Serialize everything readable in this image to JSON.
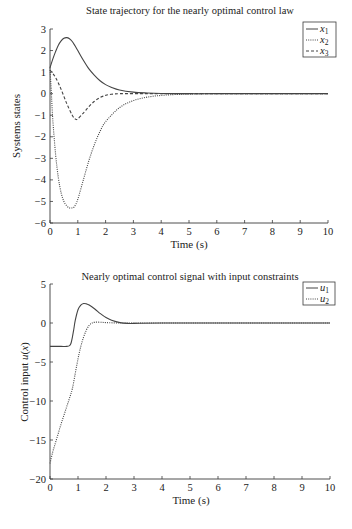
{
  "chart_data": [
    {
      "type": "line",
      "title": "State trajectory for the nearly optimal control law",
      "xlabel": "Time (s)",
      "ylabel": "Systems states",
      "xlim": [
        0,
        10
      ],
      "ylim": [
        -6,
        3
      ],
      "xticks": [
        0,
        1,
        2,
        3,
        4,
        5,
        6,
        7,
        8,
        9,
        10
      ],
      "yticks": [
        3,
        2,
        1,
        0,
        -1,
        -2,
        -3,
        -4,
        -5,
        -6
      ],
      "grid": false,
      "legend_position": "upper right",
      "series": [
        {
          "name": "x1",
          "style": "solid",
          "x": [
            0,
            0.1,
            0.2,
            0.3,
            0.4,
            0.5,
            0.6,
            0.7,
            0.8,
            0.9,
            1.0,
            1.2,
            1.4,
            1.6,
            1.8,
            2.0,
            2.2,
            2.5,
            3.0,
            3.5,
            4.0,
            5.0,
            6.0,
            8.0,
            10.0
          ],
          "values": [
            1.2,
            1.6,
            1.95,
            2.25,
            2.45,
            2.57,
            2.6,
            2.55,
            2.42,
            2.22,
            2.0,
            1.55,
            1.15,
            0.85,
            0.6,
            0.42,
            0.3,
            0.17,
            0.07,
            0.03,
            0.01,
            0.0,
            0.0,
            0.0,
            0.0
          ]
        },
        {
          "name": "x2",
          "style": "dotted",
          "x": [
            0,
            0.05,
            0.1,
            0.2,
            0.3,
            0.4,
            0.5,
            0.6,
            0.7,
            0.8,
            0.85,
            0.9,
            1.0,
            1.2,
            1.4,
            1.6,
            1.8,
            2.0,
            2.5,
            3.0,
            3.5,
            4.0,
            4.5,
            5.0,
            6.0,
            8.0,
            10.0
          ],
          "values": [
            1.2,
            0.0,
            -1.2,
            -2.8,
            -3.9,
            -4.6,
            -5.0,
            -5.2,
            -5.3,
            -5.3,
            -5.28,
            -5.2,
            -4.9,
            -4.0,
            -3.1,
            -2.35,
            -1.75,
            -1.3,
            -0.65,
            -0.32,
            -0.16,
            -0.08,
            -0.04,
            -0.02,
            0.0,
            0.0,
            0.0
          ]
        },
        {
          "name": "x3",
          "style": "dashed",
          "x": [
            0,
            0.2,
            0.4,
            0.6,
            0.8,
            0.9,
            0.95,
            1.0,
            1.2,
            1.4,
            1.6,
            1.8,
            2.0,
            2.2,
            2.5,
            3.0,
            4.0,
            6.0,
            10.0
          ],
          "values": [
            1.1,
            0.75,
            0.2,
            -0.45,
            -1.0,
            -1.17,
            -1.2,
            -1.17,
            -0.9,
            -0.6,
            -0.35,
            -0.18,
            -0.08,
            -0.03,
            0.0,
            0.0,
            0.0,
            0.0,
            0.0
          ]
        }
      ]
    },
    {
      "type": "line",
      "title": "Nearly optimal control signal with input constraints",
      "xlabel": "Time (s)",
      "ylabel": "Control input u(x)",
      "xlim": [
        0,
        10
      ],
      "ylim": [
        -20,
        5
      ],
      "xticks": [
        0,
        1,
        2,
        3,
        4,
        5,
        6,
        7,
        8,
        9,
        10
      ],
      "yticks": [
        5,
        0,
        -5,
        -10,
        -15,
        -20
      ],
      "grid": false,
      "legend_position": "upper right",
      "series": [
        {
          "name": "u1",
          "style": "solid",
          "x": [
            0,
            0.2,
            0.4,
            0.6,
            0.7,
            0.75,
            0.8,
            0.85,
            0.9,
            1.0,
            1.1,
            1.2,
            1.3,
            1.4,
            1.6,
            1.8,
            2.0,
            2.2,
            2.5,
            2.8,
            3.0,
            4.0,
            6.0,
            10.0
          ],
          "values": [
            -3.0,
            -3.0,
            -3.0,
            -3.0,
            -2.9,
            -2.6,
            -1.8,
            -0.8,
            0.3,
            1.7,
            2.3,
            2.5,
            2.45,
            2.3,
            1.8,
            1.2,
            0.7,
            0.35,
            0.05,
            -0.05,
            -0.05,
            0.0,
            0.0,
            0.0
          ]
        },
        {
          "name": "u2",
          "style": "dotted",
          "x": [
            0,
            0.1,
            0.2,
            0.3,
            0.4,
            0.5,
            0.6,
            0.7,
            0.8,
            0.9,
            1.0,
            1.1,
            1.2,
            1.3,
            1.4,
            1.5,
            1.6,
            1.8,
            2.0,
            2.5,
            3.0,
            6.0,
            10.0
          ],
          "values": [
            -18.0,
            -16.5,
            -15.3,
            -14.1,
            -12.9,
            -11.8,
            -10.7,
            -9.6,
            -8.4,
            -6.5,
            -4.6,
            -3.0,
            -1.8,
            -0.9,
            -0.3,
            0.0,
            0.1,
            0.1,
            0.05,
            0.0,
            0.0,
            0.0,
            0.0
          ]
        }
      ]
    }
  ],
  "charts": [
    {
      "title": "State trajectory for the nearly optimal control law",
      "xlabel": "Time (s)",
      "ylabel": "Systems states",
      "legend": [
        "x",
        "x",
        "x"
      ],
      "legend_sub": [
        "1",
        "2",
        "3"
      ]
    },
    {
      "title": "Nearly optimal control signal with input constraints",
      "xlabel": "Time (s)",
      "ylabel_prefix": "Control input ",
      "ylabel_u": "u",
      "ylabel_paren_open": "(",
      "ylabel_x": "x",
      "ylabel_paren_close": ")",
      "legend": [
        "u",
        "u"
      ],
      "legend_sub": [
        "1",
        "2"
      ]
    }
  ]
}
